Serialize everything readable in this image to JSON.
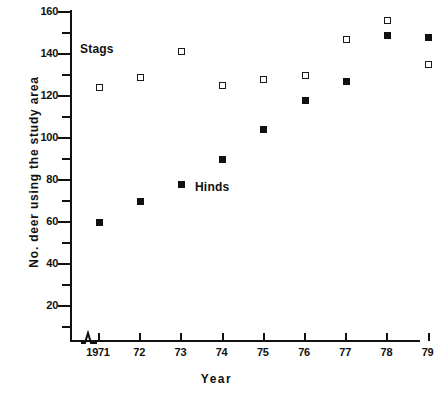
{
  "chart_data": {
    "type": "scatter",
    "title": "",
    "xlabel": "Year",
    "ylabel": "No. deer using the study area",
    "x": [
      1971,
      1972,
      1973,
      1974,
      1975,
      1976,
      1977,
      1978,
      1979
    ],
    "xtick_labels": [
      "1971",
      "72",
      "73",
      "74",
      "75",
      "76",
      "77",
      "78",
      "79"
    ],
    "ytick_labels": [
      "20",
      "40",
      "60",
      "80",
      "100",
      "120",
      "140",
      "160"
    ],
    "ytick_values": [
      20,
      40,
      60,
      80,
      100,
      120,
      140,
      160
    ],
    "yminor_values": [
      10,
      30,
      50,
      70,
      90,
      110,
      130,
      150
    ],
    "ylim": [
      0,
      160
    ],
    "xlim": [
      1970.3,
      1979.5
    ],
    "grid": false,
    "legend": "inline-annotations",
    "axis_break": true,
    "series": [
      {
        "name": "Stags",
        "marker": "open-square",
        "color": "#1a1a1a",
        "values": [
          124,
          129,
          141,
          125,
          128,
          130,
          147,
          156,
          135
        ]
      },
      {
        "name": "Hinds",
        "marker": "filled-square",
        "color": "#111111",
        "values": [
          60,
          70,
          78,
          90,
          104,
          118,
          127,
          149,
          148
        ]
      }
    ],
    "annotations": [
      {
        "text": "Stags",
        "x": 1971.2,
        "y": 145
      },
      {
        "text": "Hinds",
        "x": 1973.8,
        "y": 82
      }
    ]
  }
}
